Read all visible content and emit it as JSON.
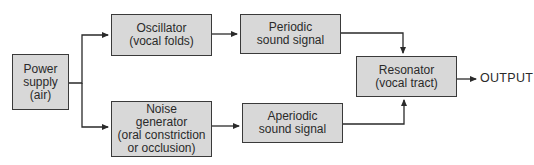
{
  "diagram": {
    "nodes": {
      "power_supply": {
        "lines": [
          "Power",
          "supply",
          "(air)"
        ]
      },
      "oscillator": {
        "lines": [
          "Oscillator",
          "(vocal folds)"
        ]
      },
      "noise_generator": {
        "lines": [
          "Noise",
          "generator",
          "(oral constriction",
          "or occlusion)"
        ]
      },
      "periodic_signal": {
        "lines": [
          "Periodic",
          "sound signal"
        ]
      },
      "aperiodic_signal": {
        "lines": [
          "Aperiodic",
          "sound signal"
        ]
      },
      "resonator": {
        "lines": [
          "Resonator",
          "(vocal tract)"
        ]
      }
    },
    "output_label": "OUTPUT",
    "edges": [
      {
        "from": "power_supply",
        "to": "oscillator"
      },
      {
        "from": "power_supply",
        "to": "noise_generator"
      },
      {
        "from": "oscillator",
        "to": "periodic_signal"
      },
      {
        "from": "noise_generator",
        "to": "aperiodic_signal"
      },
      {
        "from": "periodic_signal",
        "to": "resonator"
      },
      {
        "from": "aperiodic_signal",
        "to": "resonator"
      },
      {
        "from": "resonator",
        "to": "output"
      }
    ]
  }
}
